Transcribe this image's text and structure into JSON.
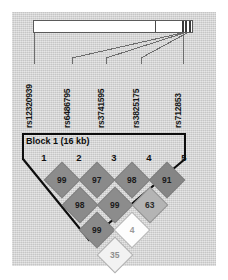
{
  "figure": {
    "type": "haploview-ld-plot",
    "background_color": "#d8d8d8",
    "panel_border_color": "#0d0d0d"
  },
  "chromosome_bar": {
    "name": "chromosome-bar",
    "fill_color": "#ffffff",
    "stroke_color": "#5a5a5a",
    "ticks": [
      {
        "name": "tick-mid",
        "x_pct": 76.5,
        "wide": false
      },
      {
        "name": "tick-cluster-1",
        "x_pct": 93.0,
        "wide": true
      },
      {
        "name": "tick-cluster-2",
        "x_pct": 95.3,
        "wide": true
      },
      {
        "name": "tick-cluster-3",
        "x_pct": 97.6,
        "wide": true
      }
    ]
  },
  "snps": [
    {
      "id": "rs12320939",
      "label": "rs12320939",
      "label_x": 36,
      "tick_x": 34,
      "marker_x": 34
    },
    {
      "id": "rs6486795",
      "label": "rs6486795",
      "label_x": 74,
      "tick_x": 72,
      "marker_x": 182
    },
    {
      "id": "rs3741595",
      "label": "rs3741595",
      "label_x": 108,
      "tick_x": 106,
      "marker_x": 184
    },
    {
      "id": "rs3825175",
      "label": "rs3825175",
      "label_x": 143,
      "tick_x": 141,
      "marker_x": 187
    },
    {
      "id": "rs712853",
      "label": "rs712853",
      "label_x": 185,
      "tick_x": 183,
      "marker_x": 190
    }
  ],
  "block": {
    "name": "block-1",
    "label": "Block 1 (16 kb)",
    "span_snps": [
      1,
      2,
      3,
      4
    ]
  },
  "column_numbers": [
    "1",
    "2",
    "3",
    "4",
    "5"
  ],
  "ld_matrix": {
    "measure": "D'",
    "note": "values are D' x 100; blank/white = low LD",
    "rows": [
      {
        "offset": 1,
        "cells": [
          {
            "pair": "1-2",
            "value": "99",
            "fill": "#8c8c8c",
            "text_color": "#1a1a1a"
          },
          {
            "pair": "2-3",
            "value": "97",
            "fill": "#8a8a8a",
            "text_color": "#1a1a1a"
          },
          {
            "pair": "3-4",
            "value": "98",
            "fill": "#8c8c8c",
            "text_color": "#1a1a1a"
          },
          {
            "pair": "4-5",
            "value": "91",
            "fill": "#858585",
            "text_color": "#1a1a1a"
          }
        ]
      },
      {
        "offset": 2,
        "cells": [
          {
            "pair": "1-3",
            "value": "98",
            "fill": "#8b8b8b",
            "text_color": "#1a1a1a"
          },
          {
            "pair": "2-4",
            "value": "99",
            "fill": "#8c8c8c",
            "text_color": "#1a1a1a"
          },
          {
            "pair": "3-5",
            "value": "63",
            "fill": "#b4b4b4",
            "text_color": "#2a2a2a"
          }
        ]
      },
      {
        "offset": 3,
        "cells": [
          {
            "pair": "1-4",
            "value": "99",
            "fill": "#8a8a8a",
            "text_color": "#1a1a1a"
          },
          {
            "pair": "2-5",
            "value": "4",
            "fill": "#fdfdfd",
            "text_color": "#9a9a9a"
          }
        ]
      },
      {
        "offset": 4,
        "cells": [
          {
            "pair": "1-5",
            "value": "35",
            "fill": "#f2f2f2",
            "text_color": "#8e8e8e"
          }
        ]
      }
    ]
  }
}
